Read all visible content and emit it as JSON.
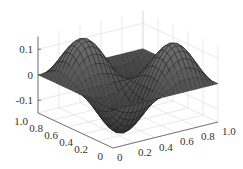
{
  "chart_data": {
    "type": "surface",
    "title": "",
    "function_description": "z = 0.15 * sin(2*pi*x) * sin(2*pi*y) style surface with two peaks and two troughs",
    "x": {
      "label": "",
      "range": [
        0,
        1
      ],
      "ticks": [
        "0",
        "0.2",
        "0.4",
        "0.6",
        "0.8",
        "1.0"
      ]
    },
    "y": {
      "label": "",
      "range": [
        0,
        1
      ],
      "ticks": [
        "0",
        "0.2",
        "0.4",
        "0.6",
        "0.8",
        "1.0"
      ]
    },
    "z": {
      "label": "",
      "range": [
        -0.15,
        0.15
      ],
      "ticks": [
        "-0.1",
        "0",
        "0.1"
      ]
    },
    "amplitude": 0.15,
    "grid": true,
    "mesh_resolution": 24,
    "colors": {
      "surface": "#555555",
      "mesh": "#1a1a1a",
      "grid": "#d9d9d9",
      "axis": "#555555"
    }
  }
}
